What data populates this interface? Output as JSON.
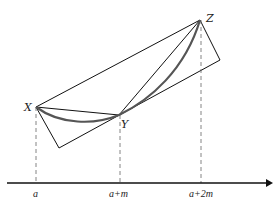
{
  "diagram": {
    "points": {
      "X": {
        "label": "X",
        "x": 36,
        "y": 107
      },
      "Y": {
        "label": "Y",
        "x": 119,
        "y": 115
      },
      "Z": {
        "label": "Z",
        "x": 200,
        "y": 20
      }
    },
    "axis": {
      "ticks": [
        {
          "label": "a",
          "x": 36
        },
        {
          "label": "a+m",
          "x": 120
        },
        {
          "label": "a+2m",
          "x": 201
        }
      ]
    },
    "colors": {
      "line": "#111111",
      "curve": "#555555",
      "dashed": "#666666"
    }
  }
}
